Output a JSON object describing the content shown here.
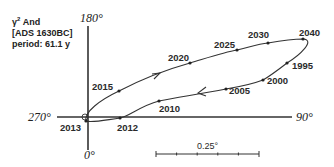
{
  "title_block": {
    "star_name": "γ",
    "star_sup": "2",
    "star_suffix": " And",
    "catalog": "[ADS 1630BC]",
    "period": "period: 61.1 y"
  },
  "axes": {
    "top_label": "180°",
    "bottom_label": "0°",
    "left_label": "270°",
    "right_label": "90°"
  },
  "scale_bar": {
    "label": "0.25°",
    "ticks": 6
  },
  "orbit": {
    "type": "ellipse",
    "direction": "counterclockwise on sky (arrows: upper branch toward 2040, lower branch toward 2012)",
    "epochs": [
      {
        "year": "2013",
        "x": 86,
        "y": 121
      },
      {
        "year": "2012",
        "x": 120,
        "y": 118
      },
      {
        "year": "2010",
        "x": 159,
        "y": 101
      },
      {
        "year": "2005",
        "x": 226,
        "y": 89
      },
      {
        "year": "2000",
        "x": 263,
        "y": 80
      },
      {
        "year": "1995",
        "x": 287,
        "y": 63
      },
      {
        "year": "2040",
        "x": 303,
        "y": 39
      },
      {
        "year": "2030",
        "x": 268,
        "y": 43
      },
      {
        "year": "2025",
        "x": 237,
        "y": 50
      },
      {
        "year": "2020",
        "x": 190,
        "y": 63
      },
      {
        "year": "2015",
        "x": 119,
        "y": 91
      }
    ]
  },
  "colors": {
    "ink": "#2a2a2a",
    "background": "#ffffff"
  }
}
